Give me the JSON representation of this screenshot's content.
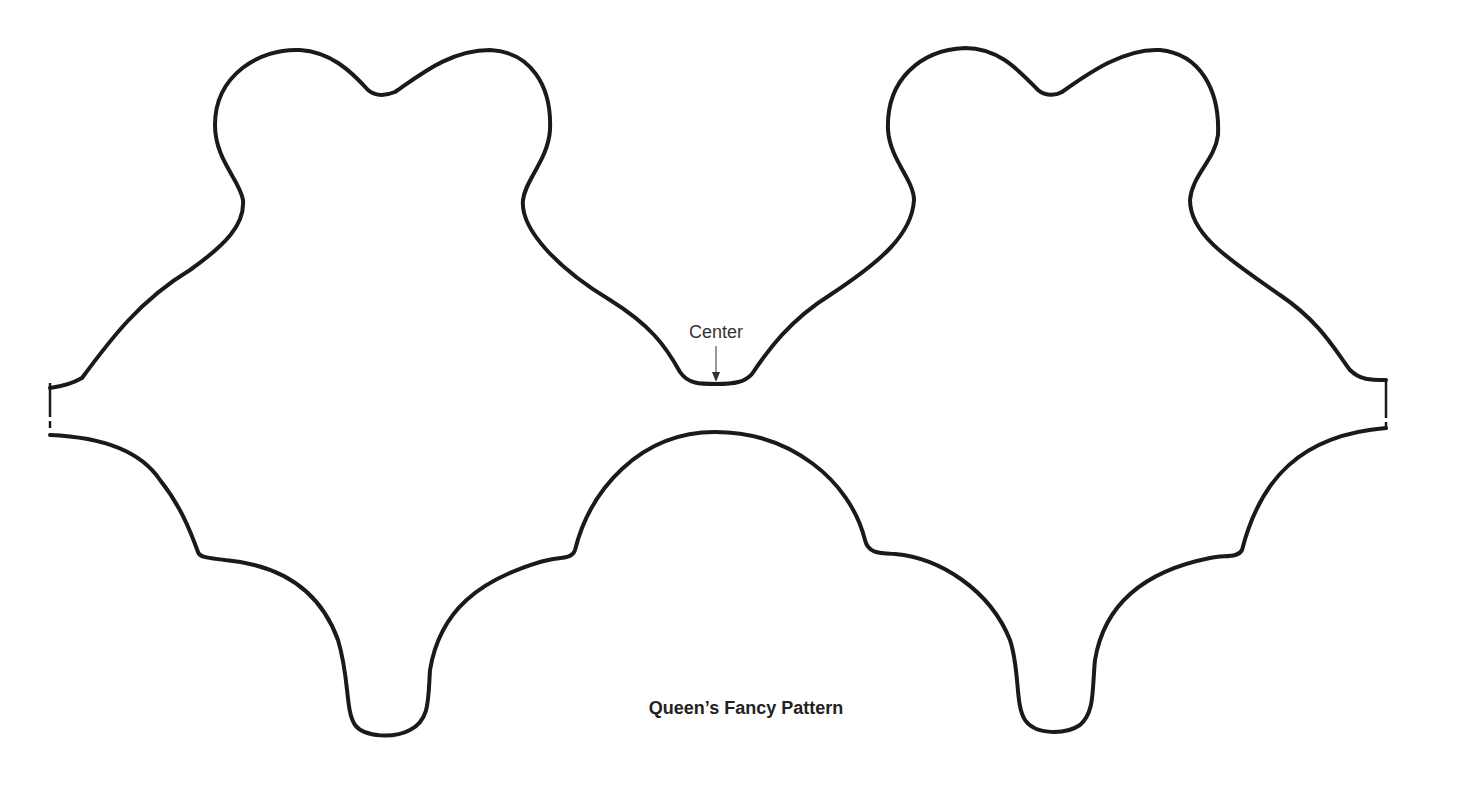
{
  "document": {
    "title": "Queen’s Fancy Pattern",
    "center_label": "Center",
    "line_color": "#1a1a1a",
    "background": "#ffffff"
  },
  "shapes": [
    {
      "name": "upper-template",
      "description": "Two rounded lobed blocks joined at a center notch, with straight cut edges at left and right"
    },
    {
      "name": "lower-template",
      "description": "Scalloped border with central dome and two rounded lobes"
    }
  ],
  "annotations": [
    {
      "label": "Center",
      "points_to": "center notch of upper template"
    }
  ]
}
